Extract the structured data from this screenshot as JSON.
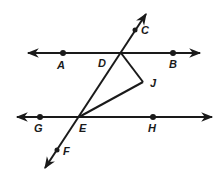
{
  "diagram": {
    "type": "geometry",
    "colors": {
      "stroke": "#1a1a1a",
      "background": "#ffffff"
    },
    "points": {
      "A": {
        "label": "A",
        "x": 63,
        "y": 53
      },
      "B": {
        "label": "B",
        "x": 173,
        "y": 53
      },
      "C": {
        "label": "C",
        "x": 135,
        "y": 30
      },
      "D": {
        "label": "D",
        "x": 121,
        "y": 53
      },
      "E": {
        "label": "E",
        "x": 79,
        "y": 117
      },
      "F": {
        "label": "F",
        "x": 57,
        "y": 150
      },
      "G": {
        "label": "G",
        "x": 40,
        "y": 117
      },
      "H": {
        "label": "H",
        "x": 153,
        "y": 117
      },
      "J": {
        "label": "J",
        "x": 143,
        "y": 82
      }
    },
    "lines": [
      {
        "name": "line-AB",
        "through": [
          "A",
          "D",
          "B"
        ],
        "arrows": "both"
      },
      {
        "name": "line-GH",
        "through": [
          "G",
          "E",
          "H"
        ],
        "arrows": "both"
      },
      {
        "name": "transversal-CF",
        "through": [
          "C",
          "D",
          "E",
          "F"
        ],
        "arrows": "both"
      }
    ],
    "segments": [
      {
        "name": "segment-DJ",
        "from": "D",
        "to": "J"
      },
      {
        "name": "segment-EJ",
        "from": "E",
        "to": "J"
      }
    ]
  }
}
